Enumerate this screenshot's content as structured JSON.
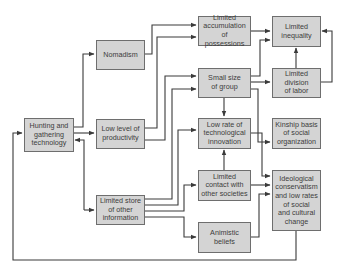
{
  "diagram": {
    "title": "",
    "colors": {
      "box_fill": "#d4d4d4",
      "box_border": "#6e6e6e",
      "line": "#3a3a3a",
      "text": "#3c3c3c"
    },
    "nodes": {
      "hunting": {
        "label": "Hunting and\ngathering\ntechnology"
      },
      "nomadism": {
        "label": "Nomadism"
      },
      "productivity": {
        "label": "Low level of\nproductivity"
      },
      "store": {
        "label": "Limited store\nof other\ninformation"
      },
      "accumulation": {
        "label": "Limited\naccumulation\nof possessions"
      },
      "small_group": {
        "label": "Small size\nof group"
      },
      "innovation": {
        "label": "Low rate of\ntechnological\ninnovation"
      },
      "contact": {
        "label": "Limited\ncontact with\nother societies"
      },
      "animistic": {
        "label": "Animistic\nbeliefs"
      },
      "inequality": {
        "label": "Limited\ninequality"
      },
      "division": {
        "label": "Limited\ndivision\nof labor"
      },
      "kinship": {
        "label": "Kinship basis\nof social\norganization"
      },
      "ideology": {
        "label": "Ideological\nconservatism\nand low rates\nof social\nand cultural\nchange"
      }
    },
    "edges": [
      {
        "from": "hunting",
        "to": "nomadism"
      },
      {
        "from": "hunting",
        "to": "productivity"
      },
      {
        "from": "hunting",
        "to": "store"
      },
      {
        "from": "store",
        "to": "hunting"
      },
      {
        "from": "nomadism",
        "to": "accumulation"
      },
      {
        "from": "nomadism",
        "to": "small_group"
      },
      {
        "from": "productivity",
        "to": "accumulation"
      },
      {
        "from": "productivity",
        "to": "small_group"
      },
      {
        "from": "store",
        "to": "innovation"
      },
      {
        "from": "store",
        "to": "contact"
      },
      {
        "from": "store",
        "to": "animistic"
      },
      {
        "from": "store",
        "to": "small_group"
      },
      {
        "from": "accumulation",
        "to": "inequality"
      },
      {
        "from": "small_group",
        "to": "inequality"
      },
      {
        "from": "small_group",
        "to": "division"
      },
      {
        "from": "small_group",
        "to": "innovation"
      },
      {
        "from": "small_group",
        "to": "kinship"
      },
      {
        "from": "division",
        "to": "inequality"
      },
      {
        "from": "innovation",
        "to": "ideology"
      },
      {
        "from": "contact",
        "to": "innovation"
      },
      {
        "from": "contact",
        "to": "ideology"
      },
      {
        "from": "animistic",
        "to": "ideology"
      },
      {
        "from": "ideology",
        "to": "hunting"
      }
    ]
  }
}
